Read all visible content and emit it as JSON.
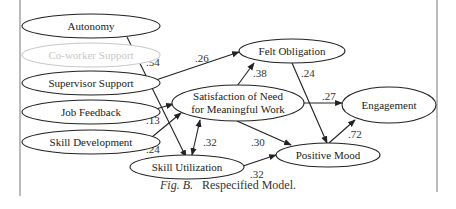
{
  "caption": {
    "figure_label": "Fig. B.",
    "title": "Respecified Model."
  },
  "nodes": {
    "autonomy": "Autonomy",
    "coworker_support": "Co-worker Support",
    "supervisor_support": "Supervisor Support",
    "job_feedback": "Job Feedback",
    "skill_development": "Skill Development",
    "satisfaction_line1": "Satisfaction of Need",
    "satisfaction_line2": "for Meaningful Work",
    "skill_utilization": "Skill Utilization",
    "felt_obligation": "Felt Obligation",
    "positive_mood": "Positive Mood",
    "engagement": "Engagement"
  },
  "edges": {
    "autonomy_to_skill_utilization": ".54",
    "supervisor_to_felt_obligation": ".26",
    "job_feedback_to_satisfaction": ".13",
    "skill_development_to_satisfaction": ".24",
    "skill_utilization_satisfaction": ".32",
    "satisfaction_to_felt_obligation": ".38",
    "felt_obligation_to_positive_mood": ".24",
    "satisfaction_to_engagement": ".27",
    "satisfaction_to_positive_mood": ".30",
    "skill_utilization_to_positive_mood": ".32",
    "positive_mood_to_engagement": ".72"
  },
  "colors": {
    "stroke": "#222222",
    "faded": "#c8c8c8",
    "border": "#777777"
  }
}
